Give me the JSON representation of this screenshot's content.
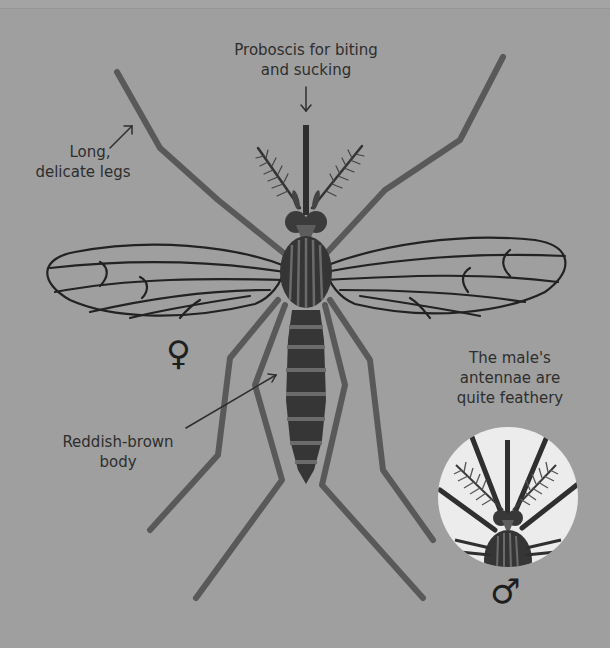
{
  "figure": {
    "colors": {
      "background": "#9f9f9f",
      "legs": "#595959",
      "body_dark": "#383838",
      "body_band": "#6b6b6b",
      "wing_vein": "#222222",
      "inset_circle": "#ececec",
      "text": "#2e2e2e"
    }
  },
  "labels": {
    "proboscis": {
      "line1": "Proboscis for biting",
      "line2": "and sucking"
    },
    "legs": {
      "line1": "Long,",
      "line2": "delicate legs"
    },
    "body": {
      "line1": "Reddish-brown",
      "line2": "body"
    },
    "male_antennae": {
      "line1": "The male's",
      "line2": "antennae are",
      "line3": "quite feathery"
    }
  },
  "symbols": {
    "female": "♀",
    "male": "♂"
  }
}
